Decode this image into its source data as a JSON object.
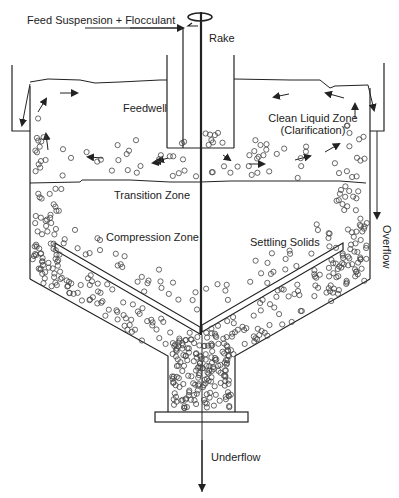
{
  "diagram": {
    "labels": {
      "feed": "Feed Suspension + Flocculant",
      "rake": "Rake",
      "feedwell": "Feedwell",
      "clean_liquid_line1": "Clean Liquid Zone",
      "clean_liquid_line2": "(Clarification)",
      "transition": "Transition Zone",
      "compression": "Compression Zone",
      "settling": "Settling Solids",
      "overflow": "Overflow",
      "underflow": "Underflow"
    },
    "components": [
      "feed-pipe",
      "rake-drive",
      "rake-shaft",
      "feedwell",
      "tank-wall",
      "overflow-launder",
      "cone-bottom",
      "rake-arms",
      "underflow-pipe",
      "flange"
    ],
    "colors": {
      "line": "#222222",
      "particle": "#444444",
      "background": "#ffffff"
    }
  }
}
